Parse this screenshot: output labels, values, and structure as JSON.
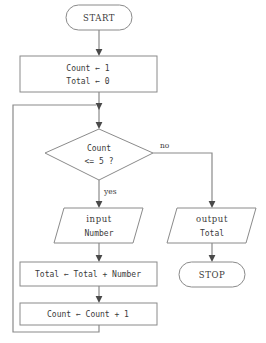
{
  "diagram": {
    "type": "flowchart",
    "nodes": {
      "start": {
        "shape": "terminator",
        "label": "START"
      },
      "init": {
        "shape": "process",
        "line1": "Count ← 1",
        "line2": "Total ← 0"
      },
      "decision": {
        "shape": "decision",
        "line1": "Count",
        "line2": "<= 5 ?"
      },
      "input": {
        "shape": "input-output",
        "line1": "input",
        "line2": "Number"
      },
      "accumulate": {
        "shape": "process",
        "line1": "Total ← Total + Number"
      },
      "increment": {
        "shape": "process",
        "line1": "Count ← Count + 1"
      },
      "output": {
        "shape": "input-output",
        "line1": "output",
        "line2": "Total"
      },
      "stop": {
        "shape": "terminator",
        "label": "STOP"
      }
    },
    "branch_labels": {
      "yes": "yes",
      "no": "no"
    },
    "colors": {
      "shape_stroke": "#8a8a8a",
      "connector_stroke": "#8a8a8a",
      "arrow_fill": "#4a4a4a",
      "text": "#3a3a3a",
      "background": "#ffffff"
    }
  }
}
